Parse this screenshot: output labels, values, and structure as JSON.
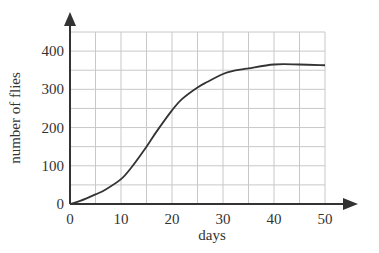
{
  "chart_data": {
    "type": "line",
    "title": "",
    "xlabel": "days",
    "ylabel": "number of flies",
    "xlim": [
      0,
      50
    ],
    "ylim": [
      0,
      450
    ],
    "x_ticks": [
      0,
      10,
      20,
      30,
      40,
      50
    ],
    "y_ticks": [
      0,
      100,
      200,
      300,
      400
    ],
    "x_tick_labels": [
      "0",
      "10",
      "20",
      "30",
      "40",
      "50"
    ],
    "y_tick_labels": [
      "0",
      "100",
      "200",
      "300",
      "400"
    ],
    "grid": true,
    "grid_x_step": 5,
    "grid_y_step": 50,
    "legend": null,
    "series": [
      {
        "name": "number of flies",
        "color": "#333333",
        "x": [
          0,
          2,
          5,
          7,
          10,
          12,
          15,
          17,
          20,
          22,
          25,
          27,
          30,
          32,
          35,
          40,
          45,
          50
        ],
        "values": [
          0,
          8,
          25,
          38,
          65,
          95,
          150,
          190,
          245,
          275,
          305,
          320,
          340,
          348,
          355,
          365,
          365,
          363
        ]
      }
    ]
  },
  "colors": {
    "axis": "#333333",
    "grid": "#c8c8c8",
    "line": "#333333"
  }
}
